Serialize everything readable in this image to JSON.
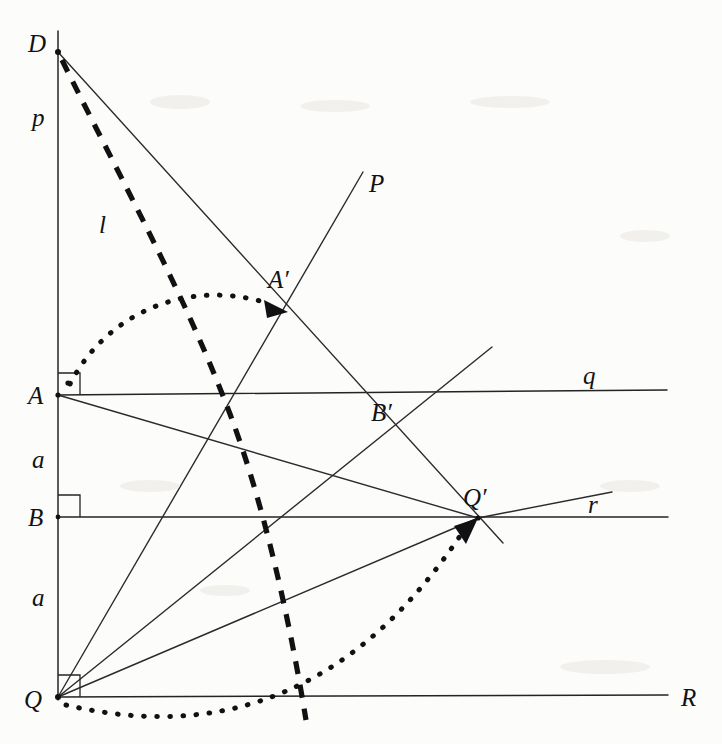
{
  "figure": {
    "kind": "euclidean-geometry-construction",
    "background_color": "#fcfcfa",
    "ink_color": "#121214",
    "width": 722,
    "height": 744
  },
  "points": [
    {
      "id": "D",
      "label": "D",
      "x": 58,
      "y": 52,
      "label_x": 28,
      "label_y": 52
    },
    {
      "id": "A",
      "label": "A",
      "x": 58,
      "y": 395,
      "label_x": 28,
      "label_y": 404
    },
    {
      "id": "B",
      "label": "B",
      "x": 58,
      "y": 517,
      "label_x": 28,
      "label_y": 526
    },
    {
      "id": "Q",
      "label": "Q",
      "x": 58,
      "y": 697,
      "label_x": 26,
      "label_y": 707
    },
    {
      "id": "A'",
      "label": "A′",
      "x": 287,
      "y": 313,
      "label_x": 272,
      "label_y": 288
    },
    {
      "id": "B'",
      "label": "B′",
      "x": 378,
      "y": 428,
      "label_x": 374,
      "label_y": 421
    },
    {
      "id": "Q'",
      "label": "Q′",
      "x": 478,
      "y": 518,
      "label_x": 466,
      "label_y": 505
    }
  ],
  "line_labels": [
    {
      "id": "p",
      "label": "p",
      "x": 36,
      "y": 125,
      "for": "vertical-line-p"
    },
    {
      "id": "l",
      "label": "l",
      "x": 103,
      "y": 232,
      "for": "dashed-line-l"
    },
    {
      "id": "P",
      "label": "P",
      "x": 372,
      "y": 192,
      "for": "ray-P"
    },
    {
      "id": "q",
      "label": "q",
      "x": 586,
      "y": 385,
      "for": "horizontal-line-q"
    },
    {
      "id": "r",
      "label": "r",
      "x": 590,
      "y": 513,
      "for": "horizontal-line-r"
    },
    {
      "id": "R",
      "label": "R",
      "x": 684,
      "y": 705,
      "for": "horizontal-line-R"
    },
    {
      "id": "a-upper",
      "label": "a",
      "x": 36,
      "y": 466,
      "for": "segment-A-B"
    },
    {
      "id": "a-lower",
      "label": "a",
      "x": 36,
      "y": 604,
      "for": "segment-B-Q"
    }
  ],
  "segments": [
    {
      "name": "vertical-line-p",
      "x1": 58,
      "y1": 31,
      "x2": 58,
      "y2": 700,
      "style": "solid"
    },
    {
      "name": "horizontal-line-q",
      "x1": 58,
      "y1": 395,
      "x2": 667,
      "y2": 390,
      "style": "solid"
    },
    {
      "name": "horizontal-line-r",
      "x1": 58,
      "y1": 517,
      "x2": 668,
      "y2": 517,
      "style": "solid"
    },
    {
      "name": "horizontal-line-R",
      "x1": 58,
      "y1": 697,
      "x2": 668,
      "y2": 695,
      "style": "solid"
    },
    {
      "name": "line-D-to-Qprime",
      "x1": 58,
      "y1": 52,
      "x2": 500,
      "y2": 540,
      "style": "solid"
    },
    {
      "name": "ray-Q-through-Aprime-to-P",
      "x1": 58,
      "y1": 697,
      "x2": 363,
      "y2": 172,
      "style": "solid"
    },
    {
      "name": "line-A-to-Qprime",
      "x1": 58,
      "y1": 395,
      "x2": 478,
      "y2": 518,
      "style": "solid"
    },
    {
      "name": "line-Q-to-Qprime",
      "x1": 58,
      "y1": 697,
      "x2": 478,
      "y2": 518,
      "style": "solid"
    },
    {
      "name": "ray-Qprime-upper-right",
      "x1": 478,
      "y1": 518,
      "x2": 612,
      "y2": 492,
      "style": "solid"
    },
    {
      "name": "ray-Qprime-through-Bprime",
      "x1": 478,
      "y1": 518,
      "x2": 477,
      "y2": 347,
      "style": "solid"
    },
    {
      "name": "segment-Q-to-Bprime-ray",
      "x1": 58,
      "y1": 697,
      "x2": 478,
      "y2": 518,
      "style": "solid"
    }
  ],
  "dashed": {
    "name": "dashed-line-l",
    "path": "M 60 58 C 120 180, 182 290, 228 412 C 262 502, 288 620, 305 718",
    "label": "l"
  },
  "arcs": [
    {
      "name": "rotation-arc-A-to-Aprime",
      "path": "M 70 384 C 110 312, 190 280, 272 306",
      "arrow_at": {
        "x": 283,
        "y": 311,
        "angle": 22
      }
    },
    {
      "name": "rotation-arc-Q-to-Qprime",
      "path": "M 64 704 C 180 730, 330 724, 462 534",
      "arrow_at": {
        "x": 472,
        "y": 523,
        "angle": -50
      }
    }
  ],
  "right_angles": [
    {
      "name": "right-angle-at-A",
      "x": 58,
      "y": 395,
      "size": 22,
      "dir_x": 1,
      "dir_y": -1,
      "has_dot": true
    },
    {
      "name": "right-angle-at-B",
      "x": 58,
      "y": 517,
      "size": 22,
      "dir_x": 1,
      "dir_y": -1,
      "has_dot": false
    },
    {
      "name": "right-angle-at-Q",
      "x": 58,
      "y": 697,
      "size": 22,
      "dir_x": 1,
      "dir_y": -1,
      "has_dot": false
    }
  ],
  "caption": ""
}
